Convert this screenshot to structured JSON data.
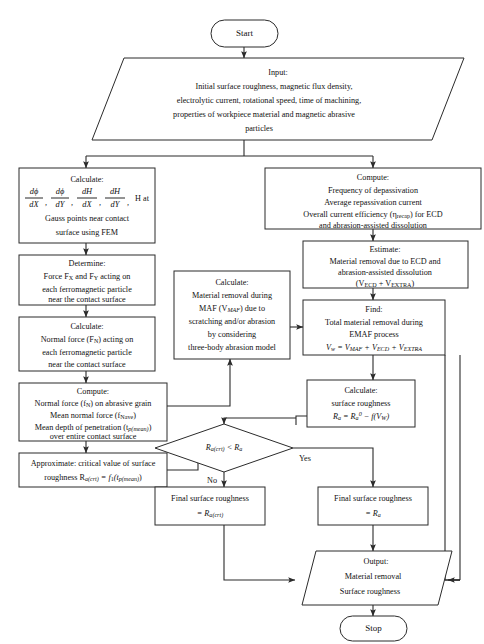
{
  "diagram": {
    "type": "flowchart",
    "stroke_color": "#2b2b2b",
    "background_color": "#ffffff"
  },
  "nodes": {
    "start": {
      "shape": "terminator",
      "label": "Start"
    },
    "input": {
      "shape": "parallelogram",
      "lines": [
        "Input:",
        "Initial surface roughness, magnetic flux density,",
        "electrolytic current, rotational speed, time of machining,",
        "properties of workpiece material and magnetic abrasive",
        "particles"
      ]
    },
    "calculate_gradients": {
      "shape": "process",
      "heading": "Calculate:",
      "formula_plain": "dΦ/dX, dΦ/dY, dH/dX, dH/dY, H at",
      "fractions": [
        {
          "num": "dϕ",
          "den": "dX"
        },
        {
          "num": "dϕ",
          "den": "dY"
        },
        {
          "num": "dH",
          "den": "dX"
        },
        {
          "num": "dH",
          "den": "dY"
        }
      ],
      "formula_tail": "H at",
      "lines_after": [
        "Gauss points near contact",
        "surface using FEM"
      ]
    },
    "determine_forces": {
      "shape": "process",
      "lines": [
        "Determine:",
        "Force F_X and F_Y acting on",
        "each ferromagnetic particle",
        "near the contact surface"
      ],
      "heading": "Determine:",
      "line2_pre": "Force F",
      "line2_sub1": "X",
      "line2_mid": " and F",
      "line2_sub2": "Y",
      "line2_post": " acting on",
      "line3": "each ferromagnetic particle",
      "line4": "near the contact surface"
    },
    "calculate_normal_force": {
      "shape": "process",
      "heading": "Calculate:",
      "line2_pre": "Normal force (F",
      "line2_sub": "N",
      "line2_post": ") acting on",
      "line3": "each ferromagnetic particle",
      "line4": "near the contact surface"
    },
    "compute_forces": {
      "shape": "process",
      "heading": "Compute:",
      "line2_pre": "Normal force (f",
      "line2_sub": "N",
      "line2_post": ") on abrasive grain",
      "line3_pre": "Mean normal force (f",
      "line3_sub": "Nave",
      "line3_post": ")",
      "line4_pre": "Mean depth of penetration (t",
      "line4_sub": "p(mean)",
      "line4_post": ")",
      "line5": "over entire contact surface"
    },
    "approximate_critical": {
      "shape": "process",
      "line1": "Approximate: critical value of surface",
      "line2_pre": "roughness R",
      "line2_sub1": "a(crt)",
      "line2_mid": " = f",
      "line2_sub2": "1",
      "line2_tail": "(t",
      "line2_sub3": "p(mean)",
      "line2_end": ")"
    },
    "compute_depassivation": {
      "shape": "process",
      "heading": "Compute:",
      "line2": "Frequency of depassivation",
      "line3": "Average repassivation current",
      "line4_pre": "Overall current efficiency (η",
      "line4_sub": "recap",
      "line4_post": ") for ECD",
      "line5": "and abrasion-assisted dissolution"
    },
    "estimate_removal": {
      "shape": "process",
      "heading": "Estimate:",
      "line2": "Material removal due to ECD and",
      "line3": "abrasion-assisted dissolution",
      "line4_pre": "(V",
      "line4_sub1": "ECD",
      "line4_mid": " + V",
      "line4_sub2": "EXTRA",
      "line4_post": ")"
    },
    "calculate_maf": {
      "shape": "process",
      "heading": "Calculate:",
      "line2": "Material removal during",
      "line3_pre": "MAF (V",
      "line3_sub": "MAF",
      "line3_post": ") due to",
      "line4": "scratching and/or abrasion",
      "line5": "by considering",
      "line6": "three-body abrasion model"
    },
    "find_total": {
      "shape": "process",
      "heading": "Find:",
      "line2": "Total material removal during",
      "line3": "EMAF process",
      "formula_pre": "V",
      "formula_sub0": "w",
      "formula_eq": " = V",
      "formula_sub1": "MAF",
      "formula_p1": " + V",
      "formula_sub2": "ECD",
      "formula_p2": " + V",
      "formula_sub3": "EXTRA"
    },
    "calculate_roughness": {
      "shape": "process",
      "heading": "Calculate:",
      "line2": "surface roughness",
      "formula_pre": "R",
      "formula_sub1": "a",
      "formula_eq": " = R",
      "formula_sub2": "a",
      "formula_sup": "0",
      "formula_minus": " − f(V",
      "formula_sub3": "W",
      "formula_end": ")"
    },
    "decision": {
      "shape": "diamond",
      "pre": "R",
      "sub1": "a(crt)",
      "mid": " < R",
      "sub2": "a"
    },
    "final_crt": {
      "shape": "process",
      "line1": "Final surface roughness",
      "line2_pre": "= R",
      "line2_sub": "a(crt)"
    },
    "final_ra": {
      "shape": "process",
      "line1": "Final surface roughness",
      "line2_pre": "= R",
      "line2_sub": "a"
    },
    "output": {
      "shape": "parallelogram",
      "lines": [
        "Output:",
        "Material removal",
        "Surface roughness"
      ]
    },
    "stop": {
      "shape": "terminator",
      "label": "Stop"
    }
  },
  "edge_labels": {
    "yes": "Yes",
    "no": "No"
  }
}
